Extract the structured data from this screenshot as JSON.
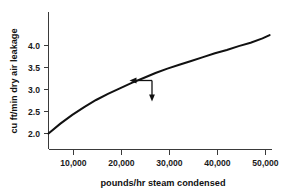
{
  "chart_data": {
    "type": "line",
    "title": "",
    "subtitle": "",
    "xlabel": "pounds/hr steam condensed",
    "ylabel": "cu ft/min dry air leakage",
    "xlim": [
      5000,
      52000
    ],
    "ylim": [
      1.78,
      4.28
    ],
    "grid": false,
    "legend": null,
    "x_ticks": [
      10000,
      20000,
      30000,
      40000,
      50000
    ],
    "x_tick_labels": [
      "10,000",
      "20,000",
      "30,000",
      "40,000",
      "50,000"
    ],
    "y_ticks": [
      2.0,
      2.5,
      3.0,
      3.5,
      4.0
    ],
    "y_tick_labels": [
      "2.0",
      "2.5",
      "3.0",
      "3.5",
      "4.0"
    ],
    "series": [
      {
        "name": "dry air leakage",
        "x": [
          5000,
          7500,
          10000,
          12500,
          15000,
          17500,
          20000,
          22500,
          25000,
          27500,
          30000,
          32500,
          35000,
          37500,
          40000,
          42500,
          45000,
          47500,
          50000,
          51500
        ],
        "values": [
          2.07,
          2.25,
          2.41,
          2.55,
          2.68,
          2.79,
          2.89,
          2.99,
          3.08,
          3.17,
          3.25,
          3.32,
          3.39,
          3.46,
          3.53,
          3.59,
          3.66,
          3.72,
          3.8,
          3.86
        ]
      }
    ],
    "annotations": [
      {
        "name": "leftward-readoff-arrow",
        "kind": "arrow",
        "direction": "left",
        "from": [
          26000,
          3.24
        ],
        "to": [
          21400,
          3.24
        ]
      },
      {
        "name": "downward-readoff-arrow",
        "kind": "arrow",
        "direction": "down",
        "from": [
          26000,
          3.24
        ],
        "to": [
          26000,
          2.82
        ]
      }
    ]
  },
  "style": {
    "background": "#ffffff",
    "curve_color": "#111111",
    "axis_color": "#3a3a3a",
    "text_color": "#1a1a1a"
  }
}
